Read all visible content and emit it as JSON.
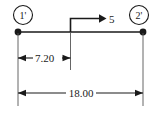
{
  "diagram": {
    "type": "structural-beam-dimension-sketch",
    "nodes": [
      {
        "id": "left",
        "label": "1'",
        "x": 18,
        "y": 32
      },
      {
        "id": "right",
        "label": "2'",
        "x": 143,
        "y": 32
      }
    ],
    "load": {
      "label": "5",
      "direction": "right",
      "station_x": 70,
      "label_x": 109,
      "label_y": 24
    },
    "dimensions": [
      {
        "id": "partial-span",
        "label": "7.20",
        "from_x": 18,
        "to_x": 70,
        "y": 58
      },
      {
        "id": "total-span",
        "label": "18.00",
        "from_x": 18,
        "to_x": 143,
        "y": 93
      }
    ],
    "colors": {
      "line": "#1a1a1a",
      "text": "#1a1a1a",
      "background": "#ffffff",
      "dimension_line": "#404040"
    }
  }
}
